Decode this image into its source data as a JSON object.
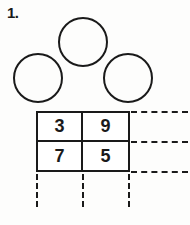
{
  "problem": {
    "number_label": "1.",
    "circles": [
      {
        "name": "circle-top",
        "value": ""
      },
      {
        "name": "circle-left",
        "value": ""
      },
      {
        "name": "circle-right",
        "value": ""
      }
    ],
    "grid": {
      "rows": [
        [
          "3",
          "9"
        ],
        [
          "7",
          "5"
        ]
      ]
    },
    "guide_lines": {
      "horizontal": [
        "top",
        "middle",
        "bottom"
      ],
      "vertical": [
        "left",
        "middle",
        "right"
      ]
    },
    "colors": {
      "ink": "#1a1a1a",
      "page": "#fdfdfc",
      "cell_fill": "#ffffff"
    }
  }
}
